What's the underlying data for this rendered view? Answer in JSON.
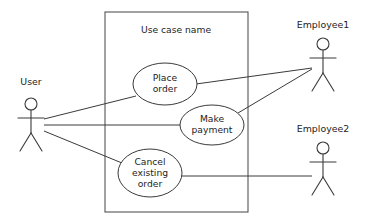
{
  "diagram": {
    "kind": "uml-use-case-diagram",
    "canvas": {
      "width": 368,
      "height": 220,
      "background": "#ffffff"
    },
    "colors": {
      "line": "#3a3a3a",
      "boundary": "#555555",
      "text": "#1d1d1d",
      "fill": "#ffffff"
    },
    "system_boundary": {
      "title": "Use case name",
      "x": 105,
      "y": 12,
      "width": 143,
      "height": 200,
      "title_x": 176,
      "title_y": 30
    },
    "use_cases": [
      {
        "id": "place-order",
        "lines": [
          "Place",
          "order"
        ],
        "cx": 165,
        "cy": 84,
        "rx": 32,
        "ry": 21
      },
      {
        "id": "make-payment",
        "lines": [
          "Make",
          "payment"
        ],
        "cx": 212,
        "cy": 125,
        "rx": 32,
        "ry": 20
      },
      {
        "id": "cancel-existing-order",
        "lines": [
          "Cancel",
          "existing",
          "order"
        ],
        "cx": 150,
        "cy": 173,
        "rx": 32,
        "ry": 24
      }
    ],
    "actors": [
      {
        "id": "user",
        "label": "User",
        "label_x": 31,
        "label_y": 82,
        "head_cx": 31,
        "head_cy": 104,
        "head_r": 6,
        "body_top": 110,
        "body_bottom": 133,
        "arm_y": 118,
        "arm_half": 13,
        "leg_spread": 11,
        "leg_bottom": 151
      },
      {
        "id": "employee1",
        "label": "Employee1",
        "label_x": 323,
        "label_y": 25,
        "head_cx": 323,
        "head_cy": 44,
        "head_r": 6,
        "body_top": 50,
        "body_bottom": 73,
        "arm_y": 58,
        "arm_half": 13,
        "leg_spread": 11,
        "leg_bottom": 91
      },
      {
        "id": "employee2",
        "label": "Employee2",
        "label_x": 323,
        "label_y": 129,
        "head_cx": 323,
        "head_cy": 148,
        "head_r": 6,
        "body_top": 154,
        "body_bottom": 177,
        "arm_y": 162,
        "arm_half": 13,
        "leg_spread": 11,
        "leg_bottom": 195
      }
    ],
    "associations": [
      {
        "id": "user-to-place-order",
        "from": "user",
        "to": "place-order",
        "x1": 44,
        "y1": 119,
        "x2": 136,
        "y2": 96
      },
      {
        "id": "user-to-make-payment",
        "from": "user",
        "to": "make-payment",
        "x1": 44,
        "y1": 125,
        "x2": 180,
        "y2": 125
      },
      {
        "id": "user-to-cancel-existing-order",
        "from": "user",
        "to": "cancel-existing-order",
        "x1": 44,
        "y1": 131,
        "x2": 122,
        "y2": 163
      },
      {
        "id": "place-order-to-employee1",
        "from": "place-order",
        "to": "employee1",
        "x1": 196,
        "y1": 84,
        "x2": 312,
        "y2": 68
      },
      {
        "id": "make-payment-to-employee1",
        "from": "make-payment",
        "to": "employee1",
        "x1": 238,
        "y1": 113,
        "x2": 312,
        "y2": 69
      },
      {
        "id": "cancel-existing-order-to-employee2",
        "from": "cancel-existing-order",
        "to": "employee2",
        "x1": 181,
        "y1": 176,
        "x2": 312,
        "y2": 176
      }
    ]
  }
}
